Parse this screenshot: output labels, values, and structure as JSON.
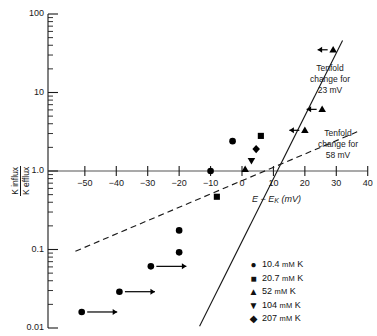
{
  "chart_data": {
    "type": "scatter",
    "title": "",
    "xlabel": "E − Eₖ (mV)",
    "ylabel_numerator": "K influx",
    "ylabel_denominator": "K efflux",
    "yscale": "log",
    "xlim": [
      -55,
      40
    ],
    "ylim": [
      0.01,
      100
    ],
    "xticks": [
      -50,
      -40,
      -30,
      -20,
      -10,
      0,
      10,
      20,
      30,
      40
    ],
    "xtick_labels": [
      "−50",
      "−40",
      "−30",
      "−20",
      "−10",
      "0",
      "10",
      "20",
      "30",
      "40"
    ],
    "yticks": [
      0.01,
      0.1,
      1.0,
      10,
      100
    ],
    "ytick_labels": [
      "0.01",
      "0.1",
      "1.0",
      "10",
      "100"
    ],
    "grid": false,
    "legend_position": "bottom-right",
    "series": [
      {
        "name": "10.4 mM K",
        "marker": "circle",
        "points": [
          {
            "x": -51,
            "y": 0.016,
            "arrow": "right"
          },
          {
            "x": -39,
            "y": 0.029,
            "arrow": "right"
          },
          {
            "x": -29,
            "y": 0.061,
            "arrow": "right"
          },
          {
            "x": -20,
            "y": 0.175
          },
          {
            "x": -20,
            "y": 0.092
          },
          {
            "x": -10,
            "y": 1.0
          },
          {
            "x": -3,
            "y": 2.4
          }
        ]
      },
      {
        "name": "20.7 mM K",
        "marker": "square",
        "points": [
          {
            "x": -8,
            "y": 0.47
          },
          {
            "x": 6,
            "y": 2.8
          }
        ]
      },
      {
        "name": "52 mM K",
        "marker": "triangle-up",
        "points": [
          {
            "x": 1,
            "y": 1.05
          },
          {
            "x": 20,
            "y": 3.3,
            "arrow": "left"
          },
          {
            "x": 25.5,
            "y": 6.1,
            "arrow": "left"
          },
          {
            "x": 29,
            "y": 35,
            "arrow": "left"
          }
        ]
      },
      {
        "name": "104 mM K",
        "marker": "triangle-down",
        "points": [
          {
            "x": 3,
            "y": 1.35
          }
        ]
      },
      {
        "name": "207 mM K",
        "marker": "diamond",
        "points": [
          {
            "x": 4.5,
            "y": 1.9
          }
        ]
      }
    ],
    "fit_lines": [
      {
        "name": "Tenfold change for 23 mV",
        "style": "solid",
        "slope_mv_per_decade": 23,
        "x_start": -13.5,
        "y_start": 0.0105,
        "x_end": 32,
        "y_end": 46
      },
      {
        "name": "Tenfold change for 58 mV",
        "style": "dashed",
        "slope_mv_per_decade": 58,
        "x_start": -53,
        "y_start": 0.095,
        "x_end": 37,
        "y_end": 3.2
      }
    ],
    "annotations": [
      {
        "name": "tenfold-23mv",
        "lines": [
          "Tenfold",
          "change for",
          "23 mV"
        ],
        "x": 330,
        "y": 63
      },
      {
        "name": "tenfold-58mv",
        "lines": [
          "Tenfold",
          "change for",
          "58 mV"
        ],
        "x": 338,
        "y": 128
      }
    ]
  },
  "legend": {
    "items": [
      {
        "symbol": "●",
        "value": "10.4",
        "unit": "mM",
        "species": "K"
      },
      {
        "symbol": "■",
        "value": "20.7",
        "unit": "mM",
        "species": "K"
      },
      {
        "symbol": "▲",
        "value": "52",
        "unit": "mM",
        "species": "K"
      },
      {
        "symbol": "▼",
        "value": "104",
        "unit": "mM",
        "species": "K"
      },
      {
        "symbol": "◆",
        "value": "207",
        "unit": "mM",
        "species": "K"
      }
    ]
  },
  "axes": {
    "x_label_main": "E − E",
    "x_label_sub": "K",
    "x_label_units": "(mV)",
    "y_label_num": "K influx",
    "y_label_den": "K efflux"
  },
  "colors": {
    "ink": "#1a1a1a",
    "background": "#ffffff",
    "marker": "#000000"
  }
}
